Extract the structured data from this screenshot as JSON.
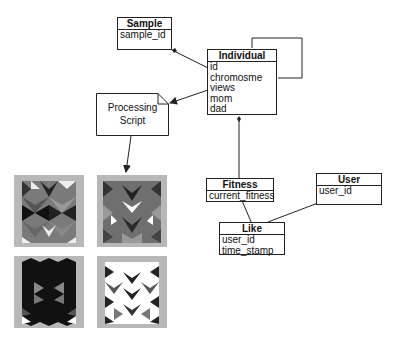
{
  "entities": {
    "sample": {
      "title": "Sample",
      "attrs": [
        "sample_id"
      ]
    },
    "individual": {
      "title": "Individual",
      "attrs": [
        "id",
        "chromosme",
        "views",
        "mom",
        "dad"
      ]
    },
    "fitness": {
      "title": "Fitness",
      "attrs": [
        "current_fitness"
      ]
    },
    "user": {
      "title": "User",
      "attrs": [
        "user_id"
      ]
    },
    "like": {
      "title": "Like",
      "attrs": [
        "user_id",
        "time_stamp"
      ]
    }
  },
  "note": {
    "line1": "Processing",
    "line2": "Script"
  },
  "colors": {
    "line": "#222222",
    "thumb_bg": "#b8b8b8"
  },
  "thumbnails": [
    "pattern-1",
    "pattern-2",
    "pattern-3",
    "pattern-4"
  ]
}
